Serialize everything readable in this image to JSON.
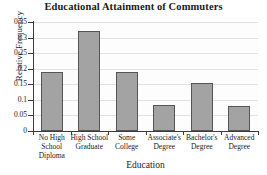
{
  "chart_data": {
    "type": "bar",
    "title": "Educational Attainment of Commuters",
    "xlabel": "Education",
    "ylabel": "Relative Frequency",
    "categories": [
      "No High School Diploma",
      "High School Graduate",
      "Some College",
      "Associate's Degree",
      "Bachelor's Degree",
      "Advanced Degree"
    ],
    "category_lines": [
      [
        "No High",
        "School",
        "Diploma"
      ],
      [
        "High School",
        "Graduate"
      ],
      [
        "Some",
        "College"
      ],
      [
        "Associate's",
        "Degree"
      ],
      [
        "Bachelor's",
        "Degree"
      ],
      [
        "Advanced",
        "Degree"
      ]
    ],
    "values": [
      0.19,
      0.32,
      0.19,
      0.085,
      0.155,
      0.08
    ],
    "ylim": [
      0,
      0.35
    ],
    "yticks": [
      0,
      0.05,
      0.1,
      0.15,
      0.2,
      0.25,
      0.3,
      0.35
    ],
    "ytick_labels": [
      "0",
      "0.05",
      "0.1",
      "0.15",
      "0.2",
      "0.25",
      "0.3",
      "0.35"
    ],
    "grid": true,
    "legend": false,
    "colors": {
      "bar_fill": "#a3a3a3",
      "bar_edge": "#555555",
      "gridline": "#e2e2e2",
      "axis": "#3c3c3c",
      "plot_background": "#fdfdfd",
      "text": "#1a1a1a"
    }
  }
}
